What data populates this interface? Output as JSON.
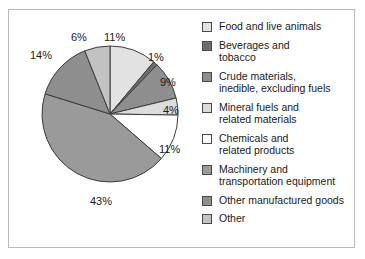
{
  "chart_data": {
    "type": "pie",
    "title": "",
    "subtitle": "",
    "xlabel": "",
    "ylabel": "",
    "legend_position": "right",
    "grid": false,
    "units": "percent",
    "categories": [
      "Food and live animals",
      "Beverages and tobacco",
      "Crude materials, inedible, excluding fuels",
      "Mineral fuels and related materials",
      "Chemicals and related products",
      "Machinery and transportation equipment",
      "Other manufactured goods",
      "Other"
    ],
    "values": [
      11,
      1,
      9,
      4,
      11,
      43,
      14,
      6
    ],
    "data_labels": [
      "11%",
      "1%",
      "9%",
      "4%",
      "11%",
      "43%",
      "14%",
      "6%"
    ],
    "colors": [
      "#e2e2e2",
      "#6e6e6e",
      "#8e8e8e",
      "#dcdcdc",
      "#ffffff",
      "#9a9a9a",
      "#8e8e8e",
      "#c2c2c2"
    ],
    "start_angle_deg": 0,
    "direction": "clockwise"
  },
  "pie": {
    "labels": [
      {
        "text": "11%",
        "left": 96,
        "top": 22
      },
      {
        "text": "1%",
        "left": 140,
        "top": 42
      },
      {
        "text": "9%",
        "left": 152,
        "top": 67
      },
      {
        "text": "4%",
        "left": 155,
        "top": 95
      },
      {
        "text": "11%",
        "left": 151,
        "top": 134
      },
      {
        "text": "43%",
        "left": 82,
        "top": 186
      },
      {
        "text": "14%",
        "left": 22,
        "top": 40
      },
      {
        "text": "6%",
        "left": 63,
        "top": 22
      }
    ]
  },
  "legend": {
    "items": [
      {
        "label": "Food and live animals",
        "color": "#e2e2e2"
      },
      {
        "label": "Beverages and\ntobacco",
        "color": "#6e6e6e"
      },
      {
        "label": "Crude materials,\ninedible, excluding fuels",
        "color": "#8e8e8e"
      },
      {
        "label": "Mineral fuels and\nrelated materials",
        "color": "#dcdcdc"
      },
      {
        "label": "Chemicals and\nrelated products",
        "color": "#ffffff"
      },
      {
        "label": "Machinery and\ntransportation equipment",
        "color": "#9a9a9a"
      },
      {
        "label": "Other manufactured goods",
        "color": "#8e8e8e"
      },
      {
        "label": "Other",
        "color": "#c2c2c2"
      }
    ]
  },
  "style": {
    "background": "#ffffff",
    "border_color": "#b9b9b9",
    "text_color": "#1a1a1a",
    "slice_outline": "#3c3c3c"
  }
}
